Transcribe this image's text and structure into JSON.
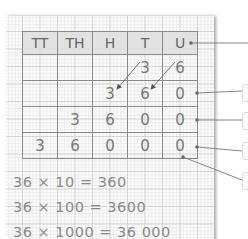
{
  "table": {
    "headers": [
      "TT",
      "TH",
      "H",
      "T",
      "U"
    ],
    "rows": [
      [
        "",
        "",
        "",
        "3",
        "6"
      ],
      [
        "",
        "",
        "3",
        "6",
        "0"
      ],
      [
        "",
        "3",
        "6",
        "0",
        "0"
      ],
      [
        "3",
        "6",
        "0",
        "0",
        "0"
      ]
    ]
  },
  "equations": [
    "36 × 10 = 360",
    "36 × 100 = 3600",
    "36 × 1000 = 36 000"
  ],
  "colors": {
    "grid_line": "#d4d4d4",
    "table_border": "#8a8a8a",
    "header_fill": "#dedede",
    "text": "#777777",
    "pointer_line": "#666666"
  }
}
